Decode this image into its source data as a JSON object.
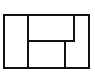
{
  "diagram": {
    "type": "rectangle-partition",
    "stroke_color": "#111111",
    "background": "#ffffff",
    "outer": {
      "x": 3,
      "y": 14,
      "w": 87,
      "h": 54
    },
    "lines": [
      {
        "id": "v-left",
        "x1": 27,
        "y1": 14,
        "x2": 27,
        "y2": 68
      },
      {
        "id": "h-mid",
        "x1": 27,
        "y1": 41,
        "x2": 74,
        "y2": 41
      },
      {
        "id": "v-upper-right",
        "x1": 74,
        "y1": 14,
        "x2": 74,
        "y2": 41
      },
      {
        "id": "v-lower-right",
        "x1": 65,
        "y1": 41,
        "x2": 65,
        "y2": 68
      }
    ],
    "regions": 5
  }
}
